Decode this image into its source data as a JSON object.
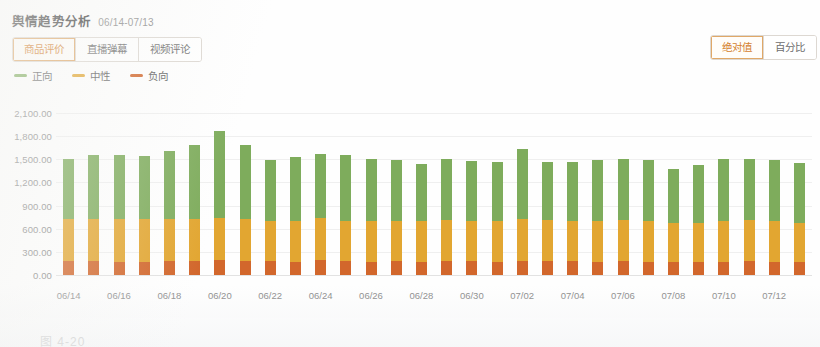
{
  "panel": {
    "title": "舆情趋势分析",
    "date_range": "06/14-07/13"
  },
  "source_tabs": {
    "items": [
      {
        "label": "商品评价",
        "active": true
      },
      {
        "label": "直播弹幕",
        "active": false
      },
      {
        "label": "视频评论",
        "active": false
      }
    ]
  },
  "value_mode_tabs": {
    "items": [
      {
        "label": "绝对值",
        "active": true
      },
      {
        "label": "百分比",
        "active": false
      }
    ]
  },
  "legend": {
    "items": [
      {
        "label": "正向",
        "color": "#7eac5c"
      },
      {
        "label": "中性",
        "color": "#e2a631"
      },
      {
        "label": "负向",
        "color": "#d2672c"
      }
    ]
  },
  "caption": {
    "text": "图 4-20"
  },
  "colors": {
    "positive": "#7eac5c",
    "neutral": "#e2a631",
    "negative": "#d2672c",
    "accent": "#d4812f",
    "axis_text": "#8b8b8b",
    "grid": "#efefef"
  },
  "chart_data": {
    "type": "bar",
    "stacked": true,
    "title": "舆情趋势分析",
    "xlabel": "",
    "ylabel": "",
    "ylim": [
      0,
      2100
    ],
    "yticks": [
      0,
      300,
      600,
      900,
      1200,
      1500,
      1800,
      2100
    ],
    "ytick_labels": [
      "0.00",
      "300.00",
      "600.00",
      "900.00",
      "1,200.00",
      "1,500.00",
      "1,800.00",
      "2,100.00"
    ],
    "grid": true,
    "legend_position": "top-left",
    "categories": [
      "06/14",
      "06/15",
      "06/16",
      "06/17",
      "06/18",
      "06/19",
      "06/20",
      "06/21",
      "06/22",
      "06/23",
      "06/24",
      "06/25",
      "06/26",
      "06/27",
      "06/28",
      "06/29",
      "06/30",
      "07/01",
      "07/02",
      "07/03",
      "07/04",
      "07/05",
      "07/06",
      "07/07",
      "07/08",
      "07/09",
      "07/10",
      "07/11",
      "07/12",
      "07/13"
    ],
    "xtick_labels": [
      "06/14",
      "06/16",
      "06/18",
      "06/20",
      "06/22",
      "06/24",
      "06/26",
      "06/28",
      "06/30",
      "07/02",
      "07/04",
      "07/06",
      "07/08",
      "07/10",
      "07/12"
    ],
    "series": [
      {
        "name": "负向",
        "color": "#d2672c",
        "values": [
          185,
          180,
          175,
          175,
          180,
          180,
          190,
          180,
          180,
          175,
          195,
          180,
          175,
          180,
          175,
          180,
          180,
          175,
          185,
          180,
          180,
          175,
          180,
          175,
          175,
          170,
          175,
          180,
          175,
          170
        ]
      },
      {
        "name": "中性",
        "color": "#e2a631",
        "values": [
          545,
          545,
          545,
          545,
          545,
          545,
          555,
          545,
          520,
          530,
          545,
          520,
          530,
          520,
          520,
          530,
          520,
          520,
          545,
          530,
          520,
          520,
          530,
          520,
          500,
          510,
          530,
          530,
          520,
          510
        ]
      },
      {
        "name": "正向",
        "color": "#7eac5c",
        "values": [
          770,
          825,
          830,
          820,
          880,
          960,
          1125,
          965,
          785,
          830,
          825,
          855,
          800,
          785,
          740,
          790,
          780,
          770,
          900,
          760,
          760,
          795,
          795,
          790,
          700,
          740,
          800,
          790,
          790,
          770
        ]
      }
    ],
    "totals": [
      1500,
      1550,
      1550,
      1540,
      1605,
      1685,
      1870,
      1690,
      1485,
      1535,
      1565,
      1555,
      1505,
      1485,
      1435,
      1500,
      1480,
      1465,
      1630,
      1470,
      1460,
      1490,
      1505,
      1485,
      1375,
      1420,
      1505,
      1500,
      1485,
      1450
    ]
  }
}
